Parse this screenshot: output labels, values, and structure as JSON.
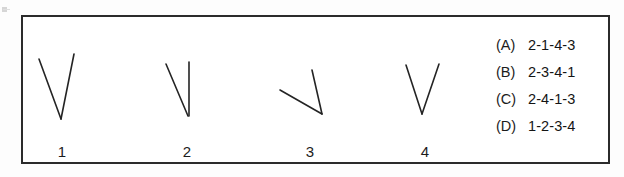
{
  "page": {
    "background_color": "#fdfdfd",
    "frame_color": "#2b2b2b"
  },
  "figures": {
    "caption_labels": [
      "1",
      "2",
      "3",
      "4"
    ],
    "items": [
      {
        "label": "1",
        "name": "figure-1-wide-v",
        "description": "wide V with vertex at bottom, left arm slanting down-right, right arm slanting down-left",
        "vertex": [
          59,
          117
        ],
        "arm_endpoints": [
          [
            37,
            57
          ],
          [
            72,
            52
          ]
        ]
      },
      {
        "label": "2",
        "name": "figure-2-narrow-v",
        "description": "narrow V, left arm slanted, right arm vertical",
        "vertex": [
          186,
          114
        ],
        "arm_endpoints": [
          [
            164,
            62
          ],
          [
            187,
            60
          ]
        ]
      },
      {
        "label": "3",
        "name": "figure-3-rotated-v",
        "description": "rotated V opening toward the upper left, widest angle",
        "vertex": [
          320,
          112
        ],
        "arm_endpoints": [
          [
            310,
            68
          ],
          [
            278,
            88
          ]
        ]
      },
      {
        "label": "4",
        "name": "figure-4-symmetric-v",
        "description": "symmetric narrow V with vertex at bottom centre",
        "vertex": [
          420,
          112
        ],
        "arm_endpoints": [
          [
            404,
            63
          ],
          [
            437,
            62
          ]
        ]
      }
    ]
  },
  "options": [
    {
      "tag": "(A)",
      "text": "2-1-4-3"
    },
    {
      "tag": "(B)",
      "text": "2-3-4-1"
    },
    {
      "tag": "(C)",
      "text": "2-4-1-3"
    },
    {
      "tag": "(D)",
      "text": "1-2-3-4"
    }
  ]
}
